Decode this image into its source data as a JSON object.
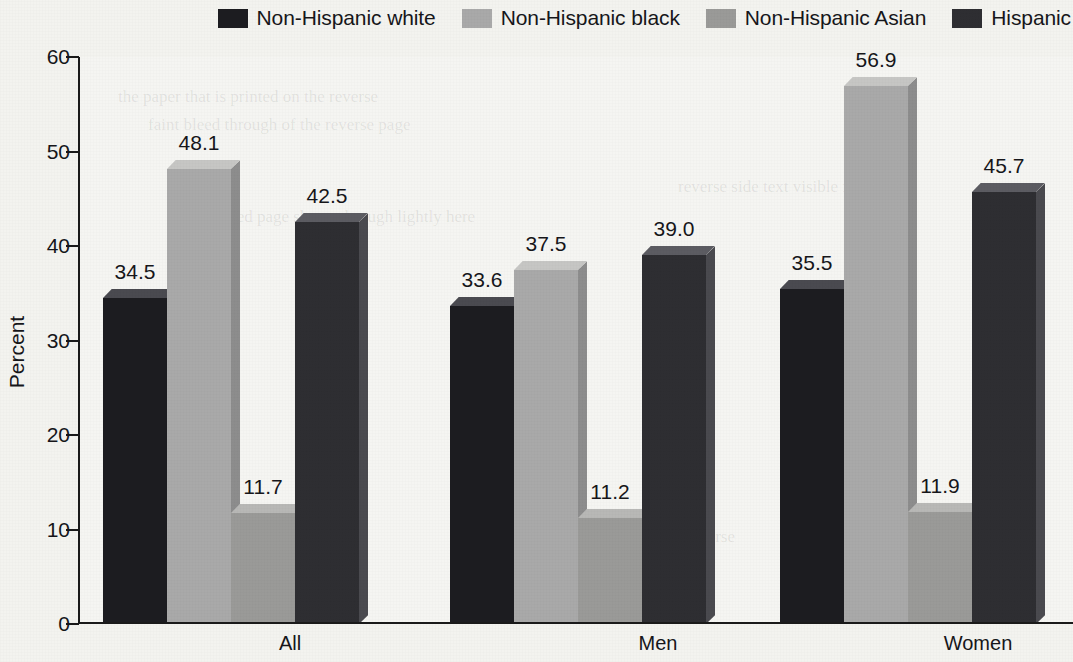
{
  "chart_data": {
    "type": "bar",
    "title": "",
    "subtitle": "",
    "xlabel": "",
    "ylabel": "Percent",
    "categories": [
      "All",
      "Men",
      "Women"
    ],
    "ylim": [
      0,
      60
    ],
    "yticks": [
      0,
      10,
      20,
      30,
      40,
      50,
      60
    ],
    "ytick_labels": [
      "0",
      "10",
      "20",
      "30",
      "40",
      "50",
      "60"
    ],
    "grid": false,
    "legend_position": "top-right",
    "series": [
      {
        "name": "Non-Hispanic white",
        "color": "#1c1c20",
        "top_color": "#4a4a50",
        "side_color": "#3a3a40",
        "values": [
          34.5,
          33.6,
          35.5
        ],
        "value_labels": [
          "34.5",
          "33.6",
          "35.5"
        ]
      },
      {
        "name": "Non-Hispanic black",
        "color": "#a9a9a9",
        "top_color": "#c6c6c4",
        "side_color": "#8d8d8d",
        "values": [
          48.1,
          37.5,
          56.9
        ],
        "value_labels": [
          "48.1",
          "37.5",
          "56.9"
        ]
      },
      {
        "name": "Non-Hispanic Asian",
        "color": "#9a9a98",
        "top_color": "#b8b8b6",
        "side_color": "#7f7f7d",
        "values": [
          11.7,
          11.2,
          11.9
        ],
        "value_labels": [
          "11.7",
          "11.2",
          "11.9"
        ]
      },
      {
        "name": "Hispanic",
        "color": "#2e2e32",
        "top_color": "#5c5c62",
        "side_color": "#4a4a4f",
        "values": [
          42.5,
          39.0,
          45.7
        ],
        "value_labels": [
          "42.5",
          "39.0",
          "45.7"
        ]
      }
    ]
  },
  "legend": {
    "items": [
      {
        "label": "Non-Hispanic white",
        "swatch": "#1c1c20"
      },
      {
        "label": "Non-Hispanic black",
        "swatch": "#a9a9a9"
      },
      {
        "label": "Non-Hispanic Asian",
        "swatch": "#9a9a98"
      },
      {
        "label": "Hispanic",
        "swatch": "#2e2e32"
      }
    ]
  },
  "axis": {
    "y_title": "Percent"
  },
  "ghost_text": [
    "the paper that is printed on the reverse",
    "faint bleed through of the reverse page",
    "scanned page shows through lightly here",
    "reverse side text visible faintly",
    "bleed through from printed reverse"
  ]
}
